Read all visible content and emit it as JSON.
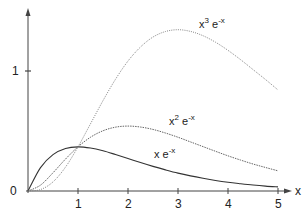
{
  "chart_data": {
    "type": "line",
    "title": "",
    "xlabel": "x",
    "ylabel": "",
    "xlim": [
      0,
      5
    ],
    "ylim": [
      0,
      1.5
    ],
    "grid": false,
    "legend": "inline labels next to curves",
    "x_ticks": [
      1,
      2,
      3,
      4,
      5
    ],
    "x_tick_labels": [
      "1",
      "2",
      "3",
      "4",
      "5"
    ],
    "y_ticks": [
      0,
      1
    ],
    "y_tick_labels": [
      "0",
      "1"
    ],
    "x": [
      0,
      0.25,
      0.5,
      0.75,
      1,
      1.25,
      1.5,
      1.75,
      2,
      2.25,
      2.5,
      2.75,
      3,
      3.25,
      3.5,
      3.75,
      4,
      4.25,
      4.5,
      4.75,
      5
    ],
    "series": [
      {
        "name": "x e^-x",
        "label_base": "x e",
        "label_exp": "-x",
        "style": "solid",
        "color": "#333333",
        "values": [
          0,
          0.195,
          0.303,
          0.354,
          0.368,
          0.358,
          0.335,
          0.304,
          0.271,
          0.237,
          0.205,
          0.176,
          0.149,
          0.126,
          0.106,
          0.088,
          0.073,
          0.061,
          0.05,
          0.041,
          0.034
        ]
      },
      {
        "name": "x^2 e^-x",
        "label_base": "x",
        "label_pow": "2",
        "label_exp": "-x",
        "style": "dashed-fine",
        "color": "#555555",
        "values": [
          0,
          0.049,
          0.152,
          0.266,
          0.368,
          0.448,
          0.502,
          0.532,
          0.541,
          0.533,
          0.513,
          0.483,
          0.448,
          0.409,
          0.37,
          0.331,
          0.293,
          0.258,
          0.225,
          0.196,
          0.168
        ]
      },
      {
        "name": "x^3 e^-x",
        "label_base": "x",
        "label_pow": "3",
        "label_exp": "-x",
        "style": "dotted",
        "color": "#777777",
        "values": [
          0,
          0.012,
          0.076,
          0.199,
          0.368,
          0.56,
          0.753,
          0.931,
          1.083,
          1.2,
          1.283,
          1.329,
          1.344,
          1.33,
          1.294,
          1.24,
          1.172,
          1.095,
          1.012,
          0.929,
          0.842
        ]
      }
    ]
  },
  "labels": {
    "x_axis": "x",
    "y0": "0",
    "y1": "1",
    "xt1": "1",
    "xt2": "2",
    "xt3": "3",
    "xt4": "4",
    "xt5": "5",
    "s1_base": "x e",
    "s1_exp": "-x",
    "s2_base": "x",
    "s2_pow": "2",
    "s2_e": " e",
    "s2_exp": "-x",
    "s3_base": "x",
    "s3_pow": "3",
    "s3_e": " e",
    "s3_exp": "-x"
  }
}
